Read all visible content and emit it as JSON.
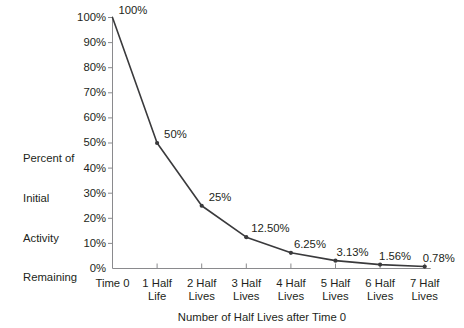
{
  "chart_data": {
    "type": "line",
    "title": "",
    "xlabel": "Number of Half Lives after Time 0",
    "ylabel": "Percent of Initial Activity Remaining",
    "categories": [
      "Time 0",
      "1 Half Life",
      "2 Half Lives",
      "3 Half Lives",
      "4 Half Lives",
      "5 Half Lives",
      "6 Half Lives",
      "7 Half Lives"
    ],
    "values": [
      100,
      50,
      25,
      12.5,
      6.25,
      3.13,
      1.56,
      0.78
    ],
    "point_labels": [
      "100%",
      "50%",
      "25%",
      "12.50%",
      "6.25%",
      "3.13%",
      "1.56%",
      "0.78%"
    ],
    "ylim": [
      0,
      100
    ],
    "ytick_values": [
      0,
      10,
      20,
      30,
      40,
      50,
      60,
      70,
      80,
      90,
      100
    ],
    "ytick_labels": [
      "0%",
      "10%",
      "20%",
      "30%",
      "40%",
      "50%",
      "60%",
      "70%",
      "80%",
      "90%",
      "100%"
    ],
    "xtick_labels": [
      {
        "line1": "Time 0",
        "line2": ""
      },
      {
        "line1": "1 Half",
        "line2": "Life"
      },
      {
        "line1": "2 Half",
        "line2": "Lives"
      },
      {
        "line1": "3 Half",
        "line2": "Lives"
      },
      {
        "line1": "4 Half",
        "line2": "Lives"
      },
      {
        "line1": "5 Half",
        "line2": "Lives"
      },
      {
        "line1": "6 Half",
        "line2": "Lives"
      },
      {
        "line1": "7 Half",
        "line2": "Lives"
      }
    ],
    "grid": false,
    "legend": "none",
    "series_color": "#3a3a3c",
    "axis_color": "#8a8a8d",
    "text_color": "#231f20",
    "marker": "dot"
  },
  "yaxis_title_lines": {
    "l1": "Percent of",
    "l2": "Initial",
    "l3": "Activity",
    "l4": "Remaining"
  },
  "xaxis_title": "Number of Half Lives after Time 0"
}
